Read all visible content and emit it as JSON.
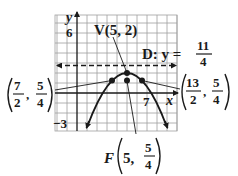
{
  "figure": {
    "type": "parabola-graph",
    "axes": {
      "x_label": "x",
      "y_label": "y",
      "x_tick_label": "7",
      "y_tick_top_label": "6",
      "y_tick_bottom_label": "−3",
      "x_range": [
        -2.2,
        10
      ],
      "y_range": [
        -3.8,
        7.8
      ],
      "grid": true
    },
    "parabola": {
      "equation": "(x-5)^2 = -3(y-2)",
      "opens": "down"
    },
    "labels": {
      "vertex": "V(5, 2)",
      "directrix_prefix": "D: y =",
      "directrix_num": "11",
      "directrix_den": "4",
      "focus_prefix": "F",
      "focus_x": "5,",
      "focus_num": "5",
      "focus_den": "4",
      "left_point_xnum": "7",
      "left_point_xden": "2",
      "left_point_ynum": "5",
      "left_point_yden": "4",
      "right_point_xnum": "13",
      "right_point_xden": "2",
      "right_point_ynum": "5",
      "right_point_yden": "4",
      "comma": ","
    },
    "points": [
      {
        "name": "vertex",
        "x": 5,
        "y": 2
      },
      {
        "name": "focus",
        "x": 5,
        "y": 1.25
      },
      {
        "name": "latus-left",
        "x": 3.5,
        "y": 1.25
      },
      {
        "name": "latus-right",
        "x": 6.5,
        "y": 1.25
      }
    ],
    "directrix_y": 2.75,
    "colors": {
      "ink": "#1a1a1a",
      "grid": "#9a9a9a"
    }
  }
}
